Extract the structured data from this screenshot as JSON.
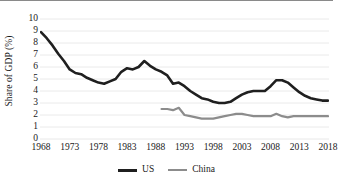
{
  "figure": {
    "background": "#ffffff",
    "border_color": "#8a8a8a"
  },
  "axis": {
    "ylabel": "Share of GDP (%)",
    "yticks": [
      "0",
      "1",
      "2",
      "3",
      "4",
      "5",
      "6",
      "7",
      "8",
      "9",
      "10"
    ],
    "xticks": [
      "1968",
      "1973",
      "1978",
      "1983",
      "1988",
      "1993",
      "1998",
      "2003",
      "2008",
      "2013",
      "2018"
    ]
  },
  "legend": {
    "items": [
      {
        "label": "US",
        "color": "#1f1f1f"
      },
      {
        "label": "China",
        "color": "#8c8c8c"
      }
    ]
  },
  "chart_data": {
    "type": "line",
    "title": "",
    "subtitle": "",
    "xlabel": "",
    "ylabel": "Share of GDP (%)",
    "xlim": [
      1968,
      2018
    ],
    "ylim": [
      0,
      10
    ],
    "ytick_step": 1,
    "xtick_step": 5,
    "grid": true,
    "grid_axis": "y",
    "grid_color": "#e8e8e8",
    "legend_position": "bottom-center",
    "x": [
      1968,
      1969,
      1970,
      1971,
      1972,
      1973,
      1974,
      1975,
      1976,
      1977,
      1978,
      1979,
      1980,
      1981,
      1982,
      1983,
      1984,
      1985,
      1986,
      1987,
      1988,
      1989,
      1990,
      1991,
      1992,
      1993,
      1994,
      1995,
      1996,
      1997,
      1998,
      1999,
      2000,
      2001,
      2002,
      2003,
      2004,
      2005,
      2006,
      2007,
      2008,
      2009,
      2010,
      2011,
      2012,
      2013,
      2014,
      2015,
      2016,
      2017,
      2018
    ],
    "series": [
      {
        "name": "US",
        "color": "#1f1f1f",
        "width": 2.6,
        "values": [
          8.9,
          8.4,
          7.8,
          7.1,
          6.5,
          5.8,
          5.5,
          5.4,
          5.1,
          4.9,
          4.7,
          4.6,
          4.8,
          5.0,
          5.6,
          5.9,
          5.8,
          6.0,
          6.5,
          6.1,
          5.8,
          5.6,
          5.3,
          4.6,
          4.7,
          4.4,
          4.0,
          3.7,
          3.4,
          3.3,
          3.1,
          3.0,
          3.0,
          3.1,
          3.4,
          3.7,
          3.9,
          4.0,
          4.0,
          4.0,
          4.4,
          4.9,
          4.9,
          4.7,
          4.3,
          3.9,
          3.6,
          3.4,
          3.3,
          3.2,
          3.2
        ]
      },
      {
        "name": "China",
        "color": "#8c8c8c",
        "width": 2.2,
        "start_year": 1989,
        "values": [
          null,
          null,
          null,
          null,
          null,
          null,
          null,
          null,
          null,
          null,
          null,
          null,
          null,
          null,
          null,
          null,
          null,
          null,
          null,
          null,
          null,
          2.5,
          2.5,
          2.4,
          2.6,
          2.0,
          1.9,
          1.8,
          1.7,
          1.7,
          1.7,
          1.8,
          1.9,
          2.0,
          2.1,
          2.1,
          2.0,
          1.9,
          1.9,
          1.9,
          1.9,
          2.1,
          1.9,
          1.8,
          1.9,
          1.9,
          1.9,
          1.9,
          1.9,
          1.9,
          1.9
        ]
      }
    ]
  }
}
